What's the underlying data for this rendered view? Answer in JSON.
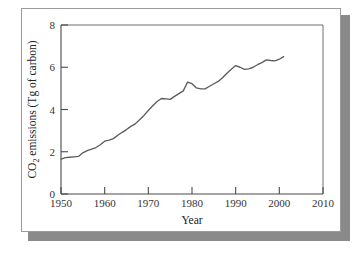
{
  "chart_data": {
    "type": "line",
    "title": "",
    "xlabel": "Year",
    "ylabel": "CO2 emissions (Tg of carbon)",
    "ylabel_parts": {
      "prefix": "CO",
      "subscript": "2",
      "suffix": " emissions (Tg of carbon)"
    },
    "xlim": [
      1950,
      2010
    ],
    "ylim": [
      0,
      8
    ],
    "xticks": [
      1950,
      1960,
      1970,
      1980,
      1990,
      2000,
      2010
    ],
    "yticks": [
      0,
      2,
      4,
      6,
      8
    ],
    "xtick_labels": [
      "1950",
      "1960",
      "1970",
      "1980",
      "1990",
      "2000",
      "2010"
    ],
    "ytick_labels": [
      "0",
      "2",
      "4",
      "6",
      "8"
    ],
    "grid": false,
    "legend": null,
    "series": [
      {
        "name": "CO2 emissions",
        "units": "Tg of carbon",
        "color": "#5c5c5c",
        "x": [
          1950,
          1951,
          1952,
          1953,
          1954,
          1955,
          1956,
          1957,
          1958,
          1959,
          1960,
          1961,
          1962,
          1963,
          1964,
          1965,
          1966,
          1967,
          1968,
          1969,
          1970,
          1971,
          1972,
          1973,
          1974,
          1975,
          1976,
          1977,
          1978,
          1979,
          1980,
          1981,
          1982,
          1983,
          1984,
          1985,
          1986,
          1987,
          1988,
          1989,
          1990,
          1991,
          1992,
          1993,
          1994,
          1995,
          1996,
          1997,
          1998,
          1999,
          2000,
          2001
        ],
        "values": [
          1.65,
          1.72,
          1.74,
          1.76,
          1.78,
          1.95,
          2.05,
          2.12,
          2.2,
          2.33,
          2.5,
          2.55,
          2.62,
          2.78,
          2.92,
          3.05,
          3.2,
          3.32,
          3.52,
          3.72,
          3.95,
          4.18,
          4.38,
          4.52,
          4.5,
          4.48,
          4.62,
          4.75,
          4.88,
          5.3,
          5.22,
          5.02,
          4.98,
          4.98,
          5.1,
          5.22,
          5.33,
          5.5,
          5.72,
          5.9,
          6.08,
          6.0,
          5.9,
          5.92,
          6.0,
          6.12,
          6.22,
          6.35,
          6.32,
          6.3,
          6.38,
          6.5
        ]
      }
    ],
    "annotations": {
      "start_value": 1.65,
      "end_value": 6.5,
      "peak_1979": 5.3,
      "trough_1982": 4.98
    }
  },
  "colors": {
    "line": "#5c5c5c",
    "axis": "#4a4a4a",
    "frame": "#6f6f6f",
    "card_border": "#9a9a9a",
    "shadow": "#8a8a8a",
    "text": "#222222",
    "background": "#ffffff"
  }
}
